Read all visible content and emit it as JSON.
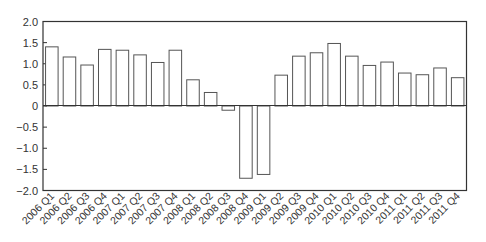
{
  "chart_data": {
    "type": "bar",
    "title": "",
    "xlabel": "",
    "ylabel": "",
    "ylim": [
      -2.0,
      2.0
    ],
    "yticks": [
      "2.0",
      "1.5",
      "1.0",
      "0.5",
      "0",
      "-0.5",
      "-1.0",
      "-1.5",
      "-2.0"
    ],
    "grid": false,
    "legend": null,
    "bar_fill": "#ffffff",
    "bar_stroke": "#555555",
    "categories": [
      "2006 Q1",
      "2006 Q2",
      "2006 Q3",
      "2006 Q4",
      "2007 Q1",
      "2007 Q2",
      "2007 Q3",
      "2007 Q4",
      "2008 Q1",
      "2008 Q2",
      "2008 Q3",
      "2008 Q4",
      "2009 Q1",
      "2009 Q2",
      "2009 Q3",
      "2009 Q4",
      "2010 Q1",
      "2010 Q2",
      "2010 Q3",
      "2010 Q4",
      "2011 Q1",
      "2011 Q2",
      "2011 Q3",
      "2011 Q4"
    ],
    "values": [
      1.4,
      1.16,
      0.97,
      1.34,
      1.32,
      1.21,
      1.03,
      1.32,
      0.62,
      0.32,
      -0.1,
      -1.71,
      -1.62,
      0.73,
      1.18,
      1.26,
      1.48,
      1.18,
      0.96,
      1.04,
      0.78,
      0.74,
      0.9,
      0.67
    ]
  }
}
